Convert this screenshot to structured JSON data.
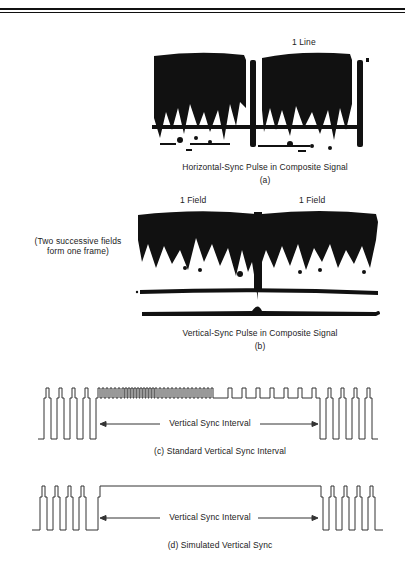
{
  "figure": {
    "panel_a": {
      "top_label": "1 Line",
      "caption": "Horizontal-Sync Pulse in Composite Signal",
      "letter": "(a)"
    },
    "panel_b": {
      "field_labels": [
        "1 Field",
        "1 Field"
      ],
      "side_note_line1": "(Two successive fields",
      "side_note_line2": "form one frame)",
      "caption": "Vertical-Sync Pulse in Composite Signal",
      "letter": "(b)"
    },
    "panel_c": {
      "interval_label": "Vertical Sync Interval",
      "caption": "(c) Standard Vertical Sync Interval"
    },
    "panel_d": {
      "interval_label": "Vertical Sync Interval",
      "caption": "(d) Simulated Vertical Sync"
    }
  },
  "colors": {
    "ink": "#111111",
    "waveform": "#333333",
    "background": "#ffffff"
  }
}
